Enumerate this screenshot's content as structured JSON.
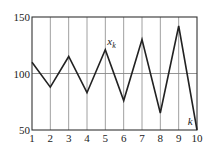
{
  "chart_data": {
    "type": "line",
    "title": "",
    "xlabel": "k",
    "ylabel": "",
    "x": [
      1,
      2,
      3,
      4,
      5,
      6,
      7,
      8,
      9,
      10
    ],
    "series": [
      {
        "name": "x_k",
        "values": [
          110,
          88,
          115,
          83,
          121,
          76,
          130,
          65,
          142,
          50
        ]
      }
    ],
    "xlim": [
      1,
      10
    ],
    "ylim": [
      50,
      150
    ],
    "yticks": [
      50,
      100,
      150
    ],
    "xticks": [
      1,
      2,
      3,
      4,
      5,
      6,
      7,
      8,
      9,
      10
    ],
    "reference_line": 100,
    "grid": {
      "vertical": true,
      "horizontal": false
    },
    "annotations": [
      {
        "text": "x_k",
        "near_x": 5,
        "near_y": 121
      },
      {
        "text": "k",
        "near_x": 9.6,
        "near_y": 57
      }
    ]
  },
  "labels": {
    "series_label_main": "x",
    "series_label_sub": "k",
    "axis_label_k": "k",
    "ytick_labels": [
      "50",
      "100",
      "150"
    ],
    "xtick_labels": [
      "1",
      "2",
      "3",
      "4",
      "5",
      "6",
      "7",
      "8",
      "9",
      "10"
    ]
  },
  "colors": {
    "line": "#222222",
    "grid": "#888888",
    "axis": "#333333",
    "background": "#ffffff"
  }
}
